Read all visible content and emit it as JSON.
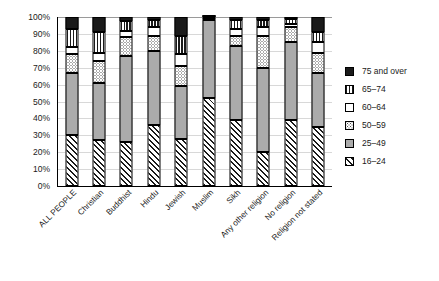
{
  "chart_data": {
    "type": "bar",
    "subtype": "stacked-percentage-column",
    "title": "",
    "xlabel": "",
    "ylabel": "",
    "ylim": [
      0,
      100
    ],
    "y_unit": "%",
    "grid": true,
    "legend_position": "right",
    "y_ticks": [
      "0%",
      "10%",
      "20%",
      "30%",
      "40%",
      "50%",
      "60%",
      "70%",
      "80%",
      "90%",
      "100%"
    ],
    "y_tick_values": [
      0,
      10,
      20,
      30,
      40,
      50,
      60,
      70,
      80,
      90,
      100
    ],
    "categories": [
      "ALL PEOPLE",
      "Christian",
      "Buddhist",
      "Hindu",
      "Jewish",
      "Muslim",
      "Sikh",
      "Any other religion",
      "No religion",
      "Religion not stated"
    ],
    "series": [
      {
        "name": "16–24",
        "pattern": "diagonal-hatch",
        "color": "#ffffff",
        "values": [
          30,
          27,
          26,
          36,
          28,
          52,
          39,
          20,
          39,
          35
        ]
      },
      {
        "name": "25–49",
        "pattern": "solid-gray",
        "color": "#ababab",
        "values": [
          37,
          34,
          51,
          44,
          31,
          46,
          44,
          50,
          46,
          32
        ]
      },
      {
        "name": "50–59",
        "pattern": "dotted",
        "color": "#ffffff",
        "values": [
          11,
          13,
          11,
          9,
          12,
          1,
          6,
          19,
          9,
          12
        ]
      },
      {
        "name": "60–64",
        "pattern": "white",
        "color": "#ffffff",
        "values": [
          4.5,
          5,
          4,
          5,
          7,
          0.5,
          4,
          5,
          2,
          6
        ]
      },
      {
        "name": "65–74",
        "pattern": "vertical-stripe",
        "color": "#ffffff",
        "values": [
          10.5,
          12,
          5.5,
          4.5,
          11,
          0.4,
          5.5,
          4.5,
          3,
          6
        ]
      },
      {
        "name": "75 and over",
        "pattern": "solid-black",
        "color": "#1a1a1a",
        "values": [
          7,
          9,
          2.5,
          1.5,
          11,
          0.1,
          1.5,
          1.5,
          1,
          9
        ]
      }
    ]
  },
  "legend": {
    "items": [
      {
        "label": "75 and over",
        "pattern": "solid-black"
      },
      {
        "label": "65–74",
        "pattern": "vertical-stripe"
      },
      {
        "label": "60–64",
        "pattern": "white"
      },
      {
        "label": "50–59",
        "pattern": "dotted"
      },
      {
        "label": "25–49",
        "pattern": "solid-gray"
      },
      {
        "label": "16–24",
        "pattern": "diagonal-hatch"
      }
    ]
  }
}
